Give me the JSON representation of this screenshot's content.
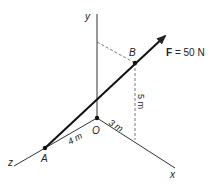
{
  "diagram": {
    "axes": {
      "x": "x",
      "y": "y",
      "z": "z"
    },
    "origin_label": "O",
    "points": {
      "A": "A",
      "B": "B"
    },
    "force": {
      "symbol": "F",
      "equals": " = 50 N"
    },
    "dimensions": {
      "z_dist": "4 m",
      "x_dist": "3 m",
      "height": "5 m"
    },
    "colors": {
      "line": "#222222",
      "dashed": "#555555"
    }
  }
}
